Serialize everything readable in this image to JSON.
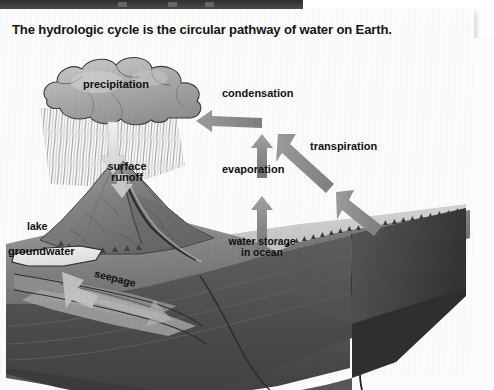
{
  "page": {
    "title": "The hydrologic cycle is the circular pathway of water on Earth."
  },
  "diagram": {
    "type": "block-diagram",
    "subject": "hydrologic cycle",
    "style": "grayscale 3D block illustration",
    "labels": {
      "precipitation": "precipitation",
      "condensation": "condensation",
      "transpiration": "transpiration",
      "evaporation": "evaporation",
      "surface_runoff_line1": "surface",
      "surface_runoff_line2": "runoff",
      "water_storage_line1": "water storage",
      "water_storage_line2": "in ocean",
      "lake": "lake",
      "groundwater": "groundwater",
      "seepage": "seepage"
    },
    "features": [
      "cumulus cloud with rain streaks",
      "mountain peak",
      "river channel",
      "coastal plain",
      "forested land on right",
      "ocean water body",
      "subsurface rock layers"
    ],
    "arrows": [
      {
        "name": "precipitation-arrow",
        "from": "cloud",
        "to": "mountain",
        "direction": "down"
      },
      {
        "name": "condensation-arrow",
        "from": "evaporation",
        "to": "cloud",
        "direction": "left"
      },
      {
        "name": "condensation-up-arrow",
        "from": "ocean",
        "to": "condensation",
        "direction": "up"
      },
      {
        "name": "transpiration-arrow",
        "from": "forest",
        "to": "condensation",
        "direction": "up-left"
      },
      {
        "name": "evaporation-arrow",
        "from": "ocean",
        "to": "sky",
        "direction": "up"
      },
      {
        "name": "groundwater-arrow",
        "from": "lake",
        "to": "subsurface",
        "direction": "down-left"
      },
      {
        "name": "seepage-arrow",
        "from": "land",
        "to": "ocean",
        "direction": "right"
      }
    ]
  },
  "colors": {
    "page_background": "#ffffff",
    "sheet": "#fbfbfb",
    "top_bar": "#35363a",
    "ink": "#111111",
    "arrow_gray": "#8e8e8e",
    "land_gray": "#8a8a8a",
    "rock_dark": "#4a4a4a",
    "water_gray": "#b9b9b9"
  }
}
